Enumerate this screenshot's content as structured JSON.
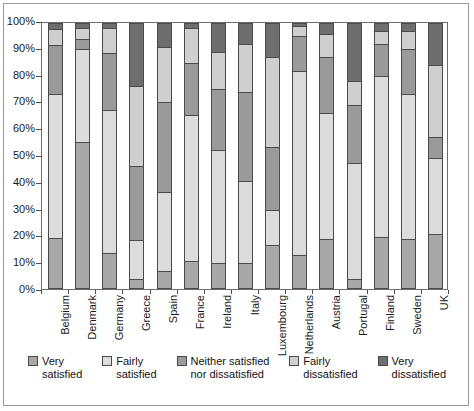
{
  "chart_data": {
    "type": "bar",
    "subtype": "stacked-100-percent",
    "title": "",
    "xlabel": "",
    "ylabel": "",
    "ylim": [
      0,
      100
    ],
    "yticks": [
      "0%",
      "10%",
      "20%",
      "30%",
      "40%",
      "50%",
      "60%",
      "70%",
      "80%",
      "90%",
      "100%"
    ],
    "grid": false,
    "legend_position": "bottom",
    "categories": [
      "Belgium",
      "Denmark",
      "Germany",
      "Greece",
      "Spain",
      "France",
      "Ireland",
      "Italy",
      "Luxembourg",
      "Netherlands",
      "Austria",
      "Portugal",
      "Finland",
      "Sweden",
      "UK"
    ],
    "series": [
      {
        "name": "Very satisfied",
        "color": "#a8a8a8",
        "values": [
          20.5,
          55.0,
          13.0,
          3.0,
          6.0,
          10.0,
          9.0,
          9.0,
          16.0,
          12.0,
          18.0,
          3.0,
          19.0,
          18.0,
          20.0
        ]
      },
      {
        "name": "Fairly satisfied",
        "color": "#dcdcdc",
        "values": [
          60.0,
          35.0,
          54.0,
          15.0,
          30.0,
          55.0,
          43.0,
          31.0,
          13.0,
          70.0,
          48.0,
          44.0,
          61.0,
          55.0,
          29.0
        ]
      },
      {
        "name": "Neither satisfied nor dissatisfied",
        "color": "#9a9a9a",
        "values": [
          20.5,
          4.0,
          21.5,
          28.0,
          34.0,
          20.0,
          23.0,
          34.0,
          24.0,
          13.0,
          21.0,
          22.0,
          12.0,
          17.0,
          8.0
        ]
      },
      {
        "name": "Fairly dissatisfied",
        "color": "#cfcfcf",
        "values": [
          6.5,
          4.0,
          9.5,
          30.0,
          21.0,
          13.0,
          14.0,
          18.0,
          34.0,
          4.0,
          9.0,
          9.0,
          5.0,
          7.0,
          27.0
        ]
      },
      {
        "name": "Very dissatisfied",
        "color": "#6e6e6e",
        "values": [
          2.5,
          2.0,
          2.0,
          24.0,
          9.0,
          2.0,
          11.0,
          8.0,
          13.0,
          1.0,
          4.0,
          22.0,
          3.0,
          3.0,
          16.0
        ]
      }
    ]
  },
  "legend": {
    "items": [
      {
        "label": "Very\nsatisfied",
        "swatch": "#a8a8a8"
      },
      {
        "label": "Fairly\nsatisfied",
        "swatch": "#dcdcdc"
      },
      {
        "label": "Neither satisfied\nnor dissatisfied",
        "swatch": "#9a9a9a"
      },
      {
        "label": "Fairly\ndissatisfied",
        "swatch": "#cfcfcf"
      },
      {
        "label": "Very\ndissatisfied",
        "swatch": "#6e6e6e"
      }
    ]
  },
  "colors": {
    "axis": "#4d4d4d",
    "bar_outline": "#4a4a4a",
    "background": "#ffffff",
    "frame": "#9a9a9a"
  }
}
